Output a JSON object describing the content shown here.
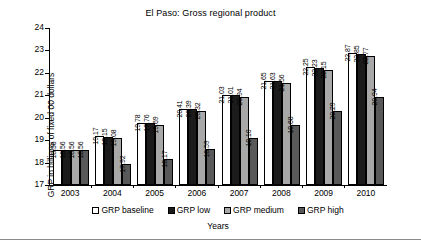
{
  "chart_data": {
    "type": "bar",
    "title": "El Paso: Gross regional product",
    "xlabel": "Years",
    "ylabel": "GRP in billions of fixed 00 dollars",
    "categories": [
      "2003",
      "2004",
      "2005",
      "2006",
      "2007",
      "2008",
      "2009",
      "2010"
    ],
    "ylim": [
      17,
      24
    ],
    "yticks": [
      17,
      18,
      19,
      20,
      21,
      22,
      23,
      24
    ],
    "grid": false,
    "legend_position": "bottom",
    "series": [
      {
        "name": "GRP baseline",
        "color": "#ffffff",
        "values": [
          18.56,
          19.17,
          19.78,
          20.41,
          21.03,
          21.65,
          22.25,
          22.87
        ]
      },
      {
        "name": "GRP low",
        "color": "#1b1b1b",
        "values": [
          18.56,
          19.15,
          19.76,
          20.39,
          21.01,
          21.63,
          22.23,
          22.85
        ]
      },
      {
        "name": "GRP medium",
        "color": "#a8a8a8",
        "values": [
          18.56,
          19.08,
          19.69,
          20.32,
          20.94,
          21.56,
          22.15,
          22.77
        ]
      },
      {
        "name": "GRP high",
        "color": "#595959",
        "values": [
          18.56,
          17.92,
          18.17,
          18.59,
          19.1,
          19.68,
          20.29,
          20.94
        ]
      }
    ],
    "value_labels": [
      [
        "18.56",
        "18.56",
        "18.56",
        "18.56"
      ],
      [
        "19.17",
        "19.15",
        "19.08",
        "17.92"
      ],
      [
        "19.78",
        "19.76",
        "19.69",
        "18.17"
      ],
      [
        "20.41",
        "20.39",
        "20.32",
        "18.59"
      ],
      [
        "21.03",
        "21.01",
        "20.94",
        "19.10"
      ],
      [
        "21.65",
        "21.63",
        "21.56",
        "19.68"
      ],
      [
        "22.25",
        "22.23",
        "22.15",
        "20.29"
      ],
      [
        "22.87",
        "22.85",
        "22.77",
        "20.94"
      ]
    ]
  }
}
